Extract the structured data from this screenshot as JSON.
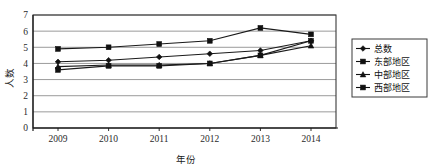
{
  "chart_data": {
    "type": "line",
    "title": "",
    "xlabel": "年份",
    "ylabel": "人数",
    "categories": [
      "2009",
      "2010",
      "2011",
      "2012",
      "2013",
      "2014"
    ],
    "x": [
      2009,
      2010,
      2011,
      2012,
      2013,
      2014
    ],
    "ylim": [
      0,
      7
    ],
    "ytick_labels": [
      "0",
      "1",
      "2",
      "3",
      "4",
      "5",
      "6",
      "7"
    ],
    "yticks": [
      0,
      1,
      2,
      3,
      4,
      5,
      6,
      7
    ],
    "grid": true,
    "legend_position": "right",
    "series": [
      {
        "name": "总数",
        "marker": "diamond",
        "color": "#111111",
        "values": [
          4.1,
          4.2,
          4.4,
          4.6,
          4.8,
          5.4
        ]
      },
      {
        "name": "东部地区",
        "marker": "square",
        "color": "#111111",
        "values": [
          4.9,
          5.0,
          5.2,
          5.4,
          6.2,
          5.8
        ]
      },
      {
        "name": "中部地区",
        "marker": "triangle",
        "color": "#111111",
        "values": [
          3.8,
          3.9,
          3.9,
          4.0,
          4.5,
          5.1
        ]
      },
      {
        "name": "西部地区",
        "marker": "square-filled",
        "color": "#111111",
        "values": [
          3.6,
          3.85,
          3.85,
          4.0,
          4.5,
          5.4
        ]
      }
    ]
  },
  "legend": {
    "items": [
      {
        "label": "总数",
        "marker": "diamond"
      },
      {
        "label": "东部地区",
        "marker": "square"
      },
      {
        "label": "中部地区",
        "marker": "triangle"
      },
      {
        "label": "西部地区",
        "marker": "square-filled"
      }
    ]
  },
  "axes": {
    "y_title": "人数",
    "x_title": "年份",
    "y_ticks": [
      "7",
      "6",
      "5",
      "4",
      "3",
      "2",
      "1",
      "0"
    ],
    "x_ticks": [
      "2009",
      "2010",
      "2011",
      "2012",
      "2013",
      "2014"
    ]
  }
}
